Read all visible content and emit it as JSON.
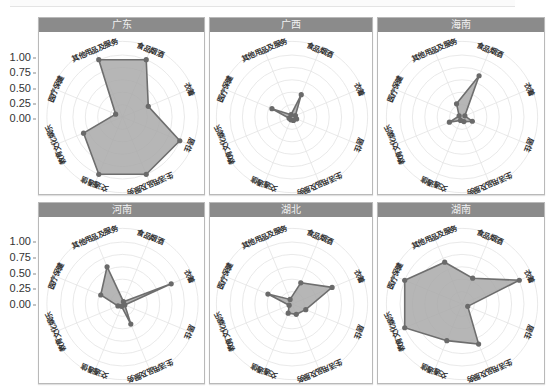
{
  "chart_data": {
    "type": "radar",
    "title": "",
    "layout": "2x3 facet grid",
    "radial_ticks": [
      "0.00",
      "0.25",
      "0.50",
      "0.75",
      "1.00"
    ],
    "radial_range": [
      0,
      1
    ],
    "axes": [
      "食品烟酒",
      "衣着",
      "居住",
      "生活用品及服务",
      "交通通信",
      "教育文化娱乐",
      "医疗保健",
      "其他用品及服务"
    ],
    "panels": [
      {
        "name": "广东",
        "values": [
          1.0,
          0.45,
          1.0,
          1.0,
          1.0,
          0.68,
          0.12,
          1.0
        ]
      },
      {
        "name": "广西",
        "values": [
          0.39,
          0.06,
          0.08,
          0.06,
          0.05,
          0.05,
          0.35,
          0.04
        ]
      },
      {
        "name": "海南",
        "values": [
          0.72,
          0.05,
          0.18,
          0.08,
          0.06,
          0.22,
          0.05,
          0.23
        ]
      },
      {
        "name": "河南",
        "values": [
          0.04,
          0.85,
          0.04,
          0.35,
          0.04,
          0.08,
          0.38,
          0.65
        ]
      },
      {
        "name": "湖北",
        "values": [
          0.37,
          0.7,
          0.24,
          0.18,
          0.16,
          0.05,
          0.42,
          0.08
        ]
      },
      {
        "name": "湖南",
        "values": [
          0.45,
          1.0,
          0.1,
          0.7,
          0.64,
          1.0,
          1.0,
          0.73
        ]
      }
    ],
    "colors": {
      "fill": "#a9a9a9",
      "stroke": "#6e6e6e",
      "point": "#6a6a6a",
      "grid": "#e3e3e3",
      "header": "#8b8b8b"
    }
  },
  "y_axis_labels": {
    "row1": [
      "1.00",
      "0.75",
      "0.50",
      "0.25",
      "0.00"
    ],
    "row2": [
      "1.00",
      "0.75",
      "0.50",
      "0.25",
      "0.00"
    ]
  },
  "panel_titles": [
    "广东",
    "广西",
    "海南",
    "河南",
    "湖北",
    "湖南"
  ]
}
